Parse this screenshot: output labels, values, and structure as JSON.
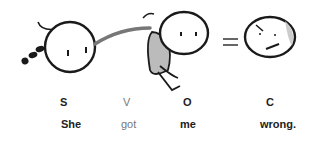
{
  "sentence": {
    "pattern": [
      {
        "role": "S",
        "word": "She"
      },
      {
        "role": "V",
        "word": "got"
      },
      {
        "role": "O",
        "word": "me"
      },
      {
        "role": "C",
        "word": "wrong."
      }
    ]
  },
  "illustration": {
    "figures": [
      "subject-figure",
      "object-figure-being-grabbed",
      "equals-sign",
      "complement-face-frowning"
    ],
    "colors": {
      "stroke": "#1a1a1a",
      "arm": "#777777",
      "body_fill": "#bbbbbb",
      "muted_text": "#777777"
    }
  }
}
